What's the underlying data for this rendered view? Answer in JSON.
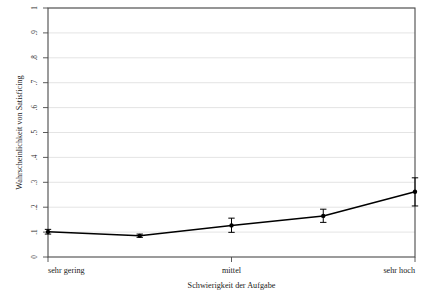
{
  "chart_data": {
    "type": "line",
    "title": "",
    "subtitle": "",
    "xlabel": "Schwierigkeit der Aufgabe",
    "ylabel": "Wahrscheinlichkeit von Satisficing",
    "xlim": [
      1,
      5
    ],
    "ylim": [
      0,
      1
    ],
    "grid": true,
    "grid_axis": "y",
    "legend": "none",
    "x": [
      1,
      2,
      3,
      4,
      5
    ],
    "x_tick_positions": [
      1,
      3,
      5
    ],
    "x_tick_labels": [
      "sehr gering",
      "mittel",
      "sehr hoch"
    ],
    "y_tick_labels": [
      "0",
      ".1",
      ".2",
      ".3",
      ".4",
      ".5",
      ".6",
      ".7",
      ".8",
      ".9",
      "1"
    ],
    "y_tick_values": [
      0,
      0.1,
      0.2,
      0.3,
      0.4,
      0.5,
      0.6,
      0.7,
      0.8,
      0.9,
      1
    ],
    "series": [
      {
        "name": "Wahrscheinlichkeit von Satisficing",
        "values": [
          0.101,
          0.085,
          0.127,
          0.165,
          0.262
        ],
        "ci_low": [
          0.092,
          0.079,
          0.099,
          0.139,
          0.205
        ],
        "ci_high": [
          0.111,
          0.092,
          0.156,
          0.192,
          0.318
        ],
        "marker": "circle",
        "color": "#000000"
      }
    ],
    "annotations": []
  }
}
